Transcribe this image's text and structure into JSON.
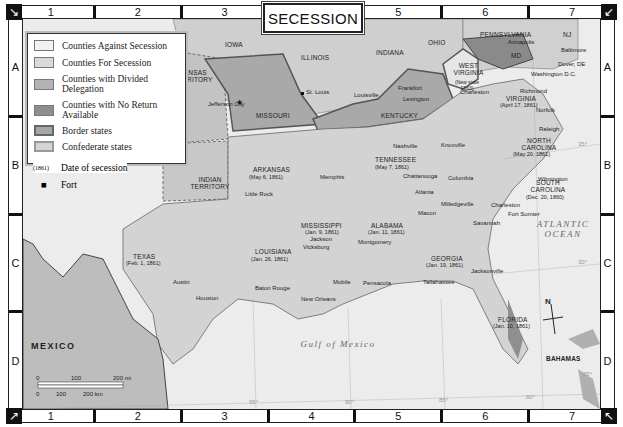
{
  "title": "SECESSION",
  "grid": {
    "columns": [
      "1",
      "2",
      "3",
      "4",
      "5",
      "6",
      "7"
    ],
    "rows": [
      "A",
      "B",
      "C",
      "D"
    ]
  },
  "legend": {
    "items": [
      {
        "label": "Counties Against Secession",
        "color": "#f2f2f2"
      },
      {
        "label": "Counties For Secession",
        "color": "#dadada"
      },
      {
        "label": "Counties with Divided Delegation",
        "color": "#b3b3b3"
      },
      {
        "label": "Counties with No Return Available",
        "color": "#8e8e8e"
      },
      {
        "label": "Border states",
        "color": "#a6a6a6"
      },
      {
        "label": "Confederate states",
        "color": "#d4d4d4"
      }
    ],
    "date_symbol": "(1861)",
    "date_label": "Date of secession",
    "fort_label": "Fort"
  },
  "states": {
    "iowa": "IOWA",
    "illinois": "ILLINOIS",
    "indiana": "INDIANA",
    "ohio": "OHIO",
    "pennsylvania": "PENNSYLVANIA",
    "nj": "NJ",
    "md": "MD",
    "kansas": "KANSAS TERRITORY",
    "missouri": "MISSOURI",
    "kentucky": "KENTUCKY",
    "west_virginia": "WEST VIRGINIA",
    "west_virginia_note": "(New state 1863)",
    "virginia": "VIRGINIA",
    "virginia_date": "(April 17, 1861)",
    "north_carolina": "NORTH CAROLINA",
    "north_carolina_date": "(May 20, 1861)",
    "tennessee": "TENNESSEE",
    "tennessee_date": "(May 7, 1861)",
    "arkansas": "ARKANSAS",
    "arkansas_date": "(May 6, 1861)",
    "indian_territory": "INDIAN TERRITORY",
    "south_carolina": "SOUTH CAROLINA",
    "south_carolina_date": "(Dec. 20, 1860)",
    "mississippi": "MISSISSIPPI",
    "mississippi_date": "(Jan. 9, 1861)",
    "alabama": "ALABAMA",
    "alabama_date": "(Jan. 11, 1861)",
    "georgia": "GEORGIA",
    "georgia_date": "(Jan. 19, 1861)",
    "louisiana": "LOUISIANA",
    "louisiana_date": "(Jan. 26, 1861)",
    "texas": "TEXAS",
    "texas_date": "(Feb. 1, 1861)",
    "florida": "FLORIDA",
    "florida_date": "(Jan. 10, 1861)",
    "mexico": "MEXICO",
    "bahamas": "BAHAMAS"
  },
  "cities": {
    "jefferson_city": "Jefferson City",
    "st_louis": "St. Louis",
    "louisville": "Louisville",
    "frankfort": "Frankfort",
    "lexington": "Lexington",
    "annapolis": "Annapolis",
    "baltimore": "Baltimore",
    "dover": "Dover, DE",
    "washington": "Washington D.C.",
    "harpers_ferry": "H. Ferry",
    "charleston_wv": "Charleston",
    "richmond": "Richmond",
    "norfolk": "Norfolk",
    "raleigh": "Raleigh",
    "wilmington": "Wilmington",
    "nashville": "Nashville",
    "knoxville": "Knoxville",
    "memphis": "Memphis",
    "chattanooga": "Chattanooga",
    "little_rock": "Little Rock",
    "columbia": "Columbia",
    "atlanta": "Atlanta",
    "milledgeville": "Milledgeville",
    "macon": "Macon",
    "charleston": "Charleston",
    "fort_sumter": "Fort Sumter",
    "savannah": "Savannah",
    "jackson": "Jackson",
    "vicksburg": "Vicksburg",
    "montgomery": "Montgomery",
    "mobile": "Mobile",
    "pensacola": "Pensacola",
    "tallahassee": "Tallahassee",
    "jacksonville": "Jacksonville",
    "baton_rouge": "Baton Rouge",
    "new_orleans": "New Orleans",
    "austin": "Austin",
    "houston": "Houston"
  },
  "water": {
    "atlantic": "ATLANTIC OCEAN",
    "gulf": "Gulf of Mexico"
  },
  "graticule": {
    "lat_35": "35°",
    "lat_30": "30°",
    "lat_25": "25°",
    "lon_95": "95°",
    "lon_90": "90°",
    "lon_85": "85°",
    "lon_80": "80°"
  },
  "scale": {
    "mi_labels": [
      "0",
      "100",
      "200 mi"
    ],
    "km_labels": [
      "0",
      "100",
      "200 km"
    ]
  },
  "compass": "N",
  "colors": {
    "ocean": "#ececec",
    "land_other": "#cfcfcf",
    "border_state": "#a9a9a9",
    "confederate": "#d3d3d3",
    "mexico": "#bdbdbd"
  }
}
